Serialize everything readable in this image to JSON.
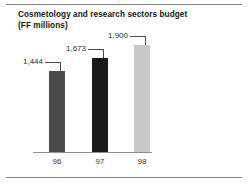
{
  "chart_data": {
    "type": "bar",
    "title": "Cosmetology and research sectors budget",
    "subtitle": "(FF millions)",
    "xlabel": "",
    "ylabel": "FF millions",
    "categories": [
      "96",
      "97",
      "98"
    ],
    "values": [
      1444,
      1673,
      1900
    ],
    "value_labels": [
      "1,444",
      "1,673",
      "1,900"
    ],
    "bar_colors": [
      "#4a4a4a",
      "#1a1a1a",
      "#c8c8c8"
    ],
    "ylim": [
      0,
      1900
    ],
    "grid": false,
    "legend": null,
    "axis_line_color": "#909090"
  },
  "frame": {
    "rule_color": "#8a8a8a",
    "background": "#ffffff"
  }
}
